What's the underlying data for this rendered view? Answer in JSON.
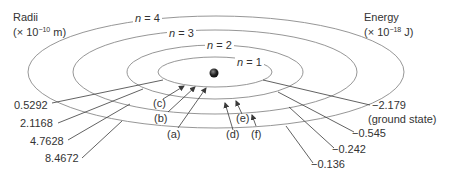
{
  "radii_header": {
    "title": "Radii",
    "unit_prefix": "(× 10",
    "unit_exp": "−10",
    "unit_suffix": " m)"
  },
  "energy_header": {
    "title": "Energy",
    "unit_prefix": "(× 10",
    "unit_exp": "−18",
    "unit_suffix": " J)"
  },
  "levels": [
    {
      "n_var": "n",
      "n_label": " = 1",
      "radius": "0.5292",
      "energy": "−2.179",
      "energy_note": "(ground state)"
    },
    {
      "n_var": "n",
      "n_label": " = 2",
      "radius": "2.1168",
      "energy": "−0.545"
    },
    {
      "n_var": "n",
      "n_label": " = 3",
      "radius": "4.7628",
      "energy": "−0.242"
    },
    {
      "n_var": "n",
      "n_label": " = 4",
      "radius": "8.4672",
      "energy": "−0.136"
    }
  ],
  "transitions": [
    {
      "label": "(a)"
    },
    {
      "label": "(b)"
    },
    {
      "label": "(c)"
    },
    {
      "label": "(d)"
    },
    {
      "label": "(e)"
    },
    {
      "label": "(f)"
    }
  ],
  "colors": {
    "orbit": "#8a8a8a",
    "leader": "#3a3a3a",
    "nucleus": "#222222",
    "text": "#333333"
  }
}
